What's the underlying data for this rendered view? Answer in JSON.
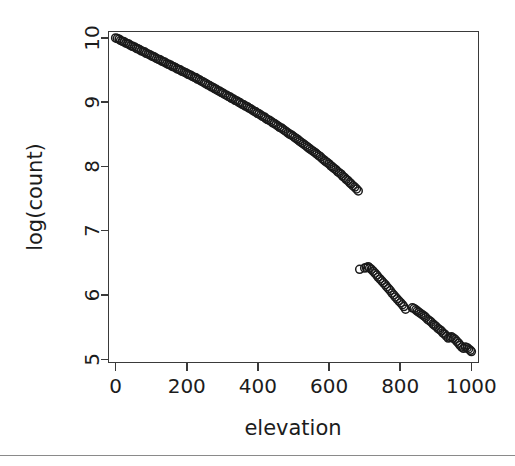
{
  "figure": {
    "background_color": "#ffffff",
    "plot_border_color": "#3a3a3a",
    "point_color": "#1a1a1a",
    "divider_color": "#8a8a8a"
  },
  "chart_data": {
    "type": "scatter",
    "title": "",
    "subtitle": "",
    "xlabel": "elevation",
    "ylabel": "log(count)",
    "xlim": [
      -20,
      1020
    ],
    "ylim": [
      4.95,
      10.1
    ],
    "xticks": [
      0,
      200,
      400,
      600,
      800,
      1000
    ],
    "xticklabels": [
      "0",
      "200",
      "400",
      "600",
      "800",
      "1000"
    ],
    "yticks": [
      5,
      6,
      7,
      8,
      9,
      10
    ],
    "yticklabels": [
      "5",
      "6",
      "7",
      "8",
      "9",
      "10"
    ],
    "grid": false,
    "legend": null,
    "marker": "open-circle",
    "marker_size": 4,
    "annotations": [],
    "x": [
      0,
      5,
      10,
      14,
      19,
      24,
      29,
      34,
      38,
      43,
      48,
      53,
      58,
      62,
      67,
      72,
      77,
      82,
      86,
      91,
      96,
      101,
      106,
      110,
      115,
      120,
      125,
      130,
      134,
      139,
      144,
      149,
      154,
      158,
      163,
      168,
      173,
      178,
      182,
      187,
      192,
      197,
      202,
      206,
      211,
      216,
      221,
      226,
      230,
      235,
      240,
      245,
      250,
      254,
      259,
      264,
      269,
      274,
      278,
      283,
      288,
      293,
      298,
      302,
      307,
      312,
      317,
      322,
      326,
      331,
      336,
      341,
      346,
      350,
      355,
      360,
      365,
      370,
      374,
      379,
      384,
      389,
      394,
      398,
      403,
      408,
      413,
      418,
      422,
      427,
      432,
      437,
      442,
      446,
      451,
      456,
      461,
      466,
      470,
      475,
      480,
      485,
      490,
      494,
      499,
      504,
      509,
      514,
      518,
      523,
      528,
      533,
      538,
      542,
      547,
      552,
      557,
      562,
      566,
      571,
      576,
      581,
      586,
      590,
      595,
      600,
      605,
      610,
      614,
      619,
      624,
      629,
      634,
      638,
      643,
      648,
      653,
      658,
      662,
      667,
      672,
      677,
      682,
      686,
      700,
      705,
      710,
      714,
      719,
      724,
      729,
      734,
      738,
      743,
      748,
      753,
      758,
      762,
      767,
      772,
      777,
      782,
      786,
      791,
      796,
      801,
      806,
      810,
      815,
      834,
      839,
      844,
      848,
      853,
      858,
      863,
      868,
      872,
      877,
      882,
      887,
      892,
      896,
      901,
      906,
      911,
      916,
      920,
      925,
      930,
      935,
      940,
      944,
      949,
      954,
      959,
      964,
      968,
      973,
      978,
      983,
      988,
      992,
      997,
      1000
    ],
    "y": [
      10.0,
      9.99,
      9.98,
      9.96,
      9.95,
      9.94,
      9.92,
      9.91,
      9.9,
      9.88,
      9.87,
      9.86,
      9.84,
      9.83,
      9.82,
      9.8,
      9.79,
      9.78,
      9.76,
      9.75,
      9.74,
      9.72,
      9.71,
      9.7,
      9.68,
      9.67,
      9.66,
      9.64,
      9.63,
      9.62,
      9.6,
      9.59,
      9.58,
      9.56,
      9.55,
      9.54,
      9.52,
      9.51,
      9.5,
      9.48,
      9.47,
      9.46,
      9.44,
      9.43,
      9.42,
      9.4,
      9.39,
      9.38,
      9.36,
      9.35,
      9.33,
      9.32,
      9.3,
      9.29,
      9.27,
      9.26,
      9.24,
      9.23,
      9.21,
      9.2,
      9.18,
      9.17,
      9.15,
      9.14,
      9.12,
      9.11,
      9.09,
      9.08,
      9.06,
      9.05,
      9.03,
      9.02,
      9.0,
      8.99,
      8.97,
      8.96,
      8.94,
      8.93,
      8.91,
      8.9,
      8.88,
      8.86,
      8.85,
      8.83,
      8.82,
      8.8,
      8.78,
      8.77,
      8.75,
      8.73,
      8.72,
      8.7,
      8.68,
      8.67,
      8.65,
      8.63,
      8.61,
      8.6,
      8.58,
      8.56,
      8.54,
      8.52,
      8.5,
      8.49,
      8.47,
      8.45,
      8.43,
      8.41,
      8.39,
      8.37,
      8.35,
      8.33,
      8.31,
      8.29,
      8.27,
      8.25,
      8.23,
      8.21,
      8.19,
      8.17,
      8.15,
      8.12,
      8.1,
      8.08,
      8.06,
      8.04,
      8.01,
      7.99,
      7.97,
      7.95,
      7.92,
      7.9,
      7.88,
      7.85,
      7.83,
      7.8,
      7.78,
      7.75,
      7.73,
      7.7,
      7.68,
      7.65,
      7.62,
      6.4,
      6.42,
      6.43,
      6.44,
      6.42,
      6.4,
      6.37,
      6.34,
      6.31,
      6.28,
      6.25,
      6.22,
      6.19,
      6.16,
      6.13,
      6.1,
      6.07,
      6.03,
      6.0,
      5.97,
      5.94,
      5.91,
      5.88,
      5.85,
      5.82,
      5.78,
      5.8,
      5.79,
      5.77,
      5.75,
      5.73,
      5.71,
      5.69,
      5.67,
      5.65,
      5.62,
      5.6,
      5.58,
      5.55,
      5.53,
      5.51,
      5.48,
      5.46,
      5.44,
      5.41,
      5.39,
      5.36,
      5.33,
      5.34,
      5.35,
      5.33,
      5.31,
      5.28,
      5.25,
      5.22,
      5.19,
      5.17,
      5.19,
      5.18,
      5.16,
      5.14,
      5.12,
      5.1,
      5.08,
      5.06
    ],
    "x_mid_segment": {
      "note": "continuation of primary trend between 686 and 700 shows a level shift downward"
    }
  }
}
